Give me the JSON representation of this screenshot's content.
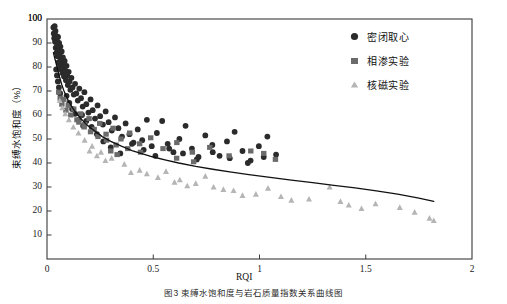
{
  "chart_data": {
    "type": "scatter",
    "title": "",
    "xlabel": "RQI",
    "ylabel": "束缚水饱和度（%）",
    "xlim": [
      0,
      2
    ],
    "ylim": [
      0,
      100
    ],
    "xticks": [
      "0",
      "0.5",
      "1",
      "1.5",
      "2"
    ],
    "xtick_values": [
      0,
      0.5,
      1,
      1.5,
      2
    ],
    "yticks": [
      "10",
      "20",
      "30",
      "40",
      "50",
      "60",
      "70",
      "80",
      "90",
      "100"
    ],
    "ytick_values": [
      10,
      20,
      30,
      40,
      50,
      60,
      70,
      80,
      90,
      100
    ],
    "grid": false,
    "legend_position": "top-right",
    "series": [
      {
        "name": "密闭取心",
        "marker": "circle",
        "color": "#2b2b2b",
        "points": [
          [
            0.03,
            96.5
          ],
          [
            0.032,
            94.0
          ],
          [
            0.034,
            92.0
          ],
          [
            0.036,
            97.0
          ],
          [
            0.038,
            90.5
          ],
          [
            0.04,
            95.0
          ],
          [
            0.041,
            88.0
          ],
          [
            0.043,
            93.0
          ],
          [
            0.045,
            86.0
          ],
          [
            0.046,
            91.0
          ],
          [
            0.048,
            89.0
          ],
          [
            0.05,
            84.5
          ],
          [
            0.052,
            92.5
          ],
          [
            0.054,
            87.0
          ],
          [
            0.055,
            82.0
          ],
          [
            0.057,
            90.0
          ],
          [
            0.059,
            85.0
          ],
          [
            0.061,
            80.5
          ],
          [
            0.063,
            88.5
          ],
          [
            0.065,
            83.0
          ],
          [
            0.067,
            79.0
          ],
          [
            0.069,
            86.5
          ],
          [
            0.071,
            81.5
          ],
          [
            0.073,
            77.5
          ],
          [
            0.075,
            84.0
          ],
          [
            0.078,
            80.0
          ],
          [
            0.08,
            76.0
          ],
          [
            0.083,
            82.5
          ],
          [
            0.086,
            78.5
          ],
          [
            0.089,
            74.5
          ],
          [
            0.092,
            80.5
          ],
          [
            0.095,
            76.5
          ],
          [
            0.098,
            72.5
          ],
          [
            0.102,
            78.0
          ],
          [
            0.106,
            74.0
          ],
          [
            0.11,
            70.5
          ],
          [
            0.115,
            75.5
          ],
          [
            0.12,
            71.5
          ],
          [
            0.126,
            68.5
          ],
          [
            0.132,
            73.0
          ],
          [
            0.138,
            69.0
          ],
          [
            0.145,
            66.0
          ],
          [
            0.152,
            71.0
          ],
          [
            0.16,
            67.0
          ],
          [
            0.168,
            63.5
          ],
          [
            0.176,
            69.5
          ],
          [
            0.185,
            64.5
          ],
          [
            0.195,
            61.0
          ],
          [
            0.205,
            66.5
          ],
          [
            0.215,
            62.0
          ],
          [
            0.226,
            58.5
          ],
          [
            0.238,
            64.0
          ],
          [
            0.25,
            59.5
          ],
          [
            0.263,
            56.0
          ],
          [
            0.276,
            61.5
          ],
          [
            0.29,
            57.0
          ],
          [
            0.305,
            53.5
          ],
          [
            0.32,
            59.0
          ],
          [
            0.336,
            54.5
          ],
          [
            0.353,
            51.0
          ],
          [
            0.37,
            56.5
          ],
          [
            0.388,
            52.0
          ],
          [
            0.407,
            48.5
          ],
          [
            0.427,
            54.0
          ],
          [
            0.448,
            49.5
          ],
          [
            0.47,
            58.0
          ],
          [
            0.493,
            47.0
          ],
          [
            0.517,
            52.5
          ],
          [
            0.542,
            57.5
          ],
          [
            0.568,
            48.0
          ],
          [
            0.595,
            44.5
          ],
          [
            0.623,
            50.0
          ],
          [
            0.652,
            55.5
          ],
          [
            0.682,
            46.0
          ],
          [
            0.713,
            42.5
          ],
          [
            0.745,
            51.5
          ],
          [
            0.778,
            47.5
          ],
          [
            0.812,
            43.0
          ],
          [
            0.847,
            49.0
          ],
          [
            0.883,
            53.0
          ],
          [
            0.92,
            45.0
          ],
          [
            0.958,
            41.0
          ],
          [
            0.997,
            47.0
          ],
          [
            1.037,
            51.0
          ],
          [
            1.078,
            43.5
          ],
          [
            0.165,
            60.0
          ],
          [
            0.185,
            57.5
          ],
          [
            0.21,
            55.0
          ],
          [
            0.235,
            52.0
          ],
          [
            0.265,
            49.0
          ],
          [
            0.3,
            46.5
          ],
          [
            0.345,
            44.0
          ],
          [
            0.4,
            48.0
          ],
          [
            0.455,
            45.5
          ],
          [
            0.51,
            43.0
          ],
          [
            0.575,
            46.0
          ],
          [
            0.64,
            44.0
          ],
          [
            0.705,
            41.5
          ],
          [
            0.78,
            44.5
          ],
          [
            0.86,
            42.0
          ],
          [
            0.945,
            40.0
          ],
          [
            1.02,
            42.5
          ],
          [
            0.092,
            68.0
          ],
          [
            0.105,
            65.0
          ],
          [
            0.118,
            62.5
          ],
          [
            0.133,
            60.5
          ],
          [
            0.15,
            58.0
          ],
          [
            0.17,
            55.5
          ],
          [
            0.043,
            79.0
          ],
          [
            0.047,
            76.5
          ],
          [
            0.051,
            74.0
          ],
          [
            0.056,
            71.5
          ],
          [
            0.062,
            69.0
          ],
          [
            0.068,
            66.5
          ]
        ]
      },
      {
        "name": "相渗实验",
        "marker": "square",
        "color": "#6b6b6b",
        "points": [
          [
            0.055,
            69.5
          ],
          [
            0.062,
            67.0
          ],
          [
            0.07,
            64.5
          ],
          [
            0.079,
            66.5
          ],
          [
            0.089,
            62.0
          ],
          [
            0.1,
            64.0
          ],
          [
            0.112,
            60.0
          ],
          [
            0.126,
            62.5
          ],
          [
            0.141,
            58.0
          ],
          [
            0.158,
            60.5
          ],
          [
            0.177,
            56.0
          ],
          [
            0.198,
            58.5
          ],
          [
            0.222,
            54.0
          ],
          [
            0.248,
            56.5
          ],
          [
            0.278,
            52.0
          ],
          [
            0.311,
            54.5
          ],
          [
            0.348,
            50.0
          ],
          [
            0.389,
            52.5
          ],
          [
            0.436,
            48.0
          ],
          [
            0.488,
            50.5
          ],
          [
            0.546,
            46.0
          ],
          [
            0.611,
            48.5
          ],
          [
            0.684,
            44.5
          ],
          [
            0.766,
            46.5
          ],
          [
            0.857,
            43.0
          ],
          [
            0.959,
            45.0
          ],
          [
            1.02,
            44.0
          ],
          [
            1.075,
            41.5
          ],
          [
            0.15,
            57.0
          ],
          [
            0.175,
            55.0
          ],
          [
            0.205,
            53.0
          ],
          [
            0.24,
            51.0
          ],
          [
            0.28,
            49.5
          ],
          [
            0.325,
            47.5
          ],
          [
            0.38,
            46.0
          ],
          [
            0.44,
            44.5
          ],
          [
            0.3,
            45.0
          ],
          [
            0.33,
            43.5
          ],
          [
            0.61,
            42.0
          ],
          [
            0.69,
            40.5
          ]
        ]
      },
      {
        "name": "核磁实验",
        "marker": "triangle",
        "color": "#b5b5b5",
        "points": [
          [
            0.06,
            66.0
          ],
          [
            0.072,
            63.0
          ],
          [
            0.086,
            60.5
          ],
          [
            0.103,
            58.0
          ],
          [
            0.124,
            55.0
          ],
          [
            0.148,
            52.5
          ],
          [
            0.177,
            49.5
          ],
          [
            0.212,
            47.0
          ],
          [
            0.254,
            44.5
          ],
          [
            0.304,
            42.0
          ],
          [
            0.364,
            39.5
          ],
          [
            0.436,
            37.0
          ],
          [
            0.47,
            35.5
          ],
          [
            0.522,
            34.0
          ],
          [
            0.56,
            36.5
          ],
          [
            0.625,
            33.0
          ],
          [
            0.7,
            31.5
          ],
          [
            0.745,
            34.5
          ],
          [
            0.784,
            30.0
          ],
          [
            0.878,
            28.5
          ],
          [
            0.983,
            27.0
          ],
          [
            1.04,
            29.5
          ],
          [
            1.101,
            26.0
          ],
          [
            1.233,
            25.0
          ],
          [
            1.33,
            30.0
          ],
          [
            1.381,
            24.0
          ],
          [
            1.42,
            22.5
          ],
          [
            1.546,
            23.0
          ],
          [
            1.66,
            21.5
          ],
          [
            1.73,
            19.5
          ],
          [
            1.8,
            17.0
          ],
          [
            1.82,
            16.0
          ],
          [
            0.2,
            45.0
          ],
          [
            0.235,
            43.0
          ],
          [
            0.275,
            41.0
          ],
          [
            0.395,
            36.0
          ],
          [
            0.6,
            32.0
          ],
          [
            0.66,
            30.5
          ],
          [
            0.83,
            29.0
          ],
          [
            0.92,
            26.5
          ],
          [
            1.15,
            24.5
          ],
          [
            1.48,
            21.0
          ]
        ]
      }
    ],
    "fit_curve": {
      "name": "拟合曲线",
      "color": "#111111",
      "points": [
        [
          0.03,
          86.0
        ],
        [
          0.04,
          82.5
        ],
        [
          0.05,
          79.0
        ],
        [
          0.06,
          75.5
        ],
        [
          0.07,
          72.5
        ],
        [
          0.08,
          70.0
        ],
        [
          0.09,
          68.0
        ],
        [
          0.1,
          66.0
        ],
        [
          0.12,
          63.0
        ],
        [
          0.14,
          60.5
        ],
        [
          0.16,
          58.5
        ],
        [
          0.18,
          56.5
        ],
        [
          0.2,
          55.0
        ],
        [
          0.23,
          53.0
        ],
        [
          0.26,
          51.0
        ],
        [
          0.3,
          49.0
        ],
        [
          0.35,
          47.0
        ],
        [
          0.4,
          45.2
        ],
        [
          0.45,
          43.8
        ],
        [
          0.5,
          42.5
        ],
        [
          0.56,
          41.2
        ],
        [
          0.62,
          40.0
        ],
        [
          0.7,
          38.6
        ],
        [
          0.78,
          37.4
        ],
        [
          0.86,
          36.3
        ],
        [
          0.95,
          35.2
        ],
        [
          1.05,
          34.0
        ],
        [
          1.15,
          32.9
        ],
        [
          1.25,
          31.8
        ],
        [
          1.35,
          30.7
        ],
        [
          1.45,
          29.6
        ],
        [
          1.55,
          28.4
        ],
        [
          1.65,
          27.0
        ],
        [
          1.75,
          25.4
        ],
        [
          1.82,
          24.0
        ]
      ]
    }
  },
  "caption": "图3 束缚水饱和度与岩石质量指数关系曲线图",
  "legend": {
    "items": [
      {
        "label": "密闭取心",
        "marker": "circle-marker"
      },
      {
        "label": "相渗实验",
        "marker": "square-marker"
      },
      {
        "label": "核磁实验",
        "marker": "triangle-marker"
      }
    ]
  }
}
